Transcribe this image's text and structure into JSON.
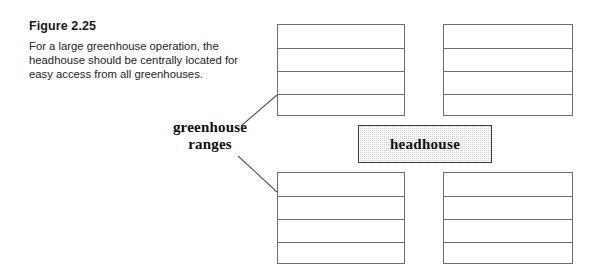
{
  "figure": {
    "title": "Figure 2.25",
    "caption_lines": [
      "For a large greenhouse operation, the",
      "headhouse should be centrally located for",
      "easy access from all greenhouses."
    ]
  },
  "diagram": {
    "headhouse": {
      "label": "headhouse",
      "fill_color": "#d2d2d2",
      "border_color": "#3a3a3a",
      "x": 358,
      "y": 125,
      "width": 134,
      "height": 38
    },
    "ranges_label": {
      "line1": "greenhouse",
      "line2": "ranges"
    },
    "line_color": "#6d6d6d",
    "leader_lines": [
      {
        "name": "leader-to-upper-range",
        "x1": 241,
        "y1": 126,
        "x2": 277,
        "y2": 95
      },
      {
        "name": "leader-to-lower-range",
        "x1": 238,
        "y1": 156,
        "x2": 277,
        "y2": 192
      }
    ],
    "ranges": [
      {
        "name": "upper-range",
        "blocks": [
          {
            "name": "upper-left-block",
            "x": 277,
            "y": 24,
            "width": 128,
            "height": 92,
            "bays": 4
          },
          {
            "name": "upper-right-block",
            "x": 443,
            "y": 24,
            "width": 130,
            "height": 92,
            "bays": 4
          }
        ]
      },
      {
        "name": "lower-range",
        "blocks": [
          {
            "name": "lower-left-block",
            "x": 277,
            "y": 172,
            "width": 128,
            "height": 92,
            "bays": 4
          },
          {
            "name": "lower-right-block",
            "x": 443,
            "y": 172,
            "width": 130,
            "height": 92,
            "bays": 4
          }
        ]
      }
    ]
  }
}
